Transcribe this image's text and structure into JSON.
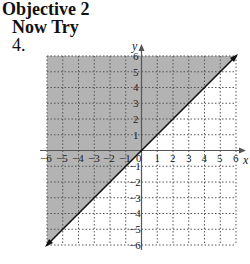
{
  "header": {
    "objective": "Objective 2",
    "section": "Now Try",
    "problem_number": "4."
  },
  "graph": {
    "x_axis_label": "x",
    "y_axis_label": "y",
    "x_tick_labels": [
      "−6",
      "−5",
      "−4",
      "−3",
      "−2",
      "−1",
      "0",
      "1",
      "2",
      "3",
      "4",
      "5",
      "6"
    ],
    "y_tick_labels": [
      "6",
      "5",
      "4",
      "3",
      "2",
      "1",
      "−1",
      "−2",
      "−3",
      "−4",
      "−5",
      "−6"
    ],
    "xlim": [
      -6,
      6
    ],
    "ylim": [
      -6,
      6
    ],
    "boundary_line": "y = x",
    "boundary_style": "solid",
    "shaded_region": "y ≥ x (above the line)",
    "shade_color": "#b3b3b3",
    "grid_color": "#555555",
    "axis_color": "#555555"
  }
}
